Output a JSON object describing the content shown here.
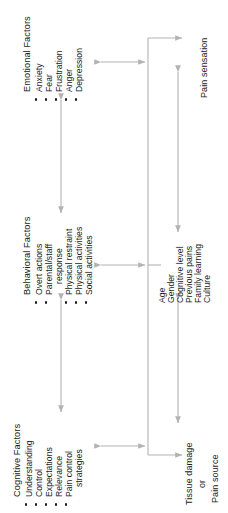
{
  "diagram": {
    "orientation": "rotated-90-ccw",
    "line_color": "#b3b3b3",
    "text_color": "#1a1a1a",
    "groups": [
      {
        "id": "emotional",
        "title": "Emotional Factors",
        "items": [
          "Anxiety",
          "Fear",
          "Frustration",
          "Anger",
          "Depression"
        ]
      },
      {
        "id": "behavioral",
        "title": "Behavioral Factors",
        "items": [
          "Overt actions",
          "Parental/staff",
          "response",
          "Physical restraint",
          "Physical activities",
          "Social activities"
        ]
      },
      {
        "id": "cognitive",
        "title": "Cognitive Factors",
        "items": [
          "Understanding",
          "Control",
          "Expectations",
          "Relevance",
          "Pain control",
          "strategies"
        ]
      }
    ],
    "modifiers": {
      "id": "modifiers",
      "items": [
        "Age",
        "Gender",
        "Cognitive level",
        "Previous pains",
        "Family learning",
        "Culture"
      ]
    },
    "nodes": {
      "pain_sensation": "Pain sensation",
      "tissue_damage_line1": "Tissue damage",
      "tissue_damage_line2": "or",
      "tissue_damage_line3": "Pain source"
    }
  }
}
